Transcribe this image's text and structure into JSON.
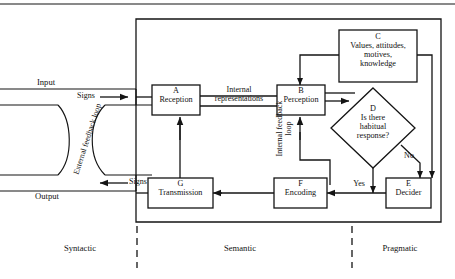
{
  "diagram": {
    "colors": {
      "line": "#141414",
      "text": "#111111",
      "background": "#ffffff"
    },
    "nodes": [
      {
        "key": "a",
        "id": "A",
        "label": "Reception",
        "shape": "rect"
      },
      {
        "key": "b",
        "id": "B",
        "label": "Perception",
        "shape": "rect"
      },
      {
        "key": "c",
        "id": "C",
        "label": "Values, attitudes,\nmotives,\nknowledge",
        "line1": "Values, attitudes,",
        "line2": "motives,",
        "line3": "knowledge",
        "shape": "rect"
      },
      {
        "key": "d",
        "id": "D",
        "label": "Is there\nhabitual\nresponse?",
        "line1": "Is there",
        "line2": "habitual",
        "line3": "response?",
        "shape": "diamond"
      },
      {
        "key": "e",
        "id": "E",
        "label": "Decider",
        "shape": "rect"
      },
      {
        "key": "f",
        "id": "F",
        "label": "Encoding",
        "shape": "rect"
      },
      {
        "key": "g",
        "id": "G",
        "label": "Transmission",
        "shape": "rect"
      }
    ],
    "edge_labels": {
      "internal_representations_line1": "Internal",
      "internal_representations_line2": "representations",
      "signs_in": "Signs",
      "signs_out": "Signs",
      "yes": "Yes",
      "no": "No",
      "internal_feedback_loop": "Internal feedback loop",
      "external_feedback_loop": "External feedback loop"
    },
    "io_labels": {
      "input": "Input",
      "output": "Output"
    },
    "zones": [
      {
        "key": "syntactic",
        "label": "Syntactic"
      },
      {
        "key": "semantic",
        "label": "Semantic"
      },
      {
        "key": "pragmatic",
        "label": "Pragmatic"
      }
    ]
  }
}
